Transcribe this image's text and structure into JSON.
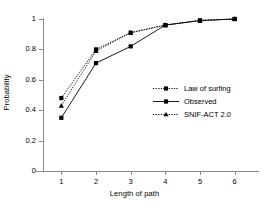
{
  "chart_data": {
    "type": "line",
    "title": "",
    "xlabel": "Length of path",
    "ylabel": "Probability",
    "x": [
      1,
      2,
      3,
      4,
      5,
      6
    ],
    "categories": [
      "1",
      "2",
      "3",
      "4",
      "5",
      "6"
    ],
    "xtick_labels": [
      "1",
      "2",
      "3",
      "4",
      "5",
      "6"
    ],
    "ytick_labels": [
      "0",
      "0.2",
      "0.4",
      "0.6",
      "0.8",
      "1"
    ],
    "ytick_values": [
      0,
      0.2,
      0.4,
      0.6,
      0.8,
      1
    ],
    "ylim": [
      0,
      1
    ],
    "xlim": [
      0.5,
      6.5
    ],
    "grid": false,
    "legend_position": "center-right",
    "series": [
      {
        "name": "Law of surfing",
        "values": [
          0.48,
          0.8,
          0.91,
          0.96,
          0.99,
          1.0
        ],
        "marker": "square",
        "line_style": "dotted",
        "color": "#000000"
      },
      {
        "name": "Observed",
        "values": [
          0.35,
          0.71,
          0.82,
          0.96,
          0.99,
          1.0
        ],
        "marker": "square",
        "line_style": "solid",
        "color": "#000000"
      },
      {
        "name": "SNIF-ACT 2.0",
        "values": [
          0.43,
          0.79,
          0.91,
          0.96,
          0.99,
          1.0
        ],
        "marker": "triangle",
        "line_style": "dotted",
        "color": "#000000"
      }
    ]
  },
  "axes": {
    "x_title": "Length of path",
    "y_title": "Probability"
  },
  "legend": {
    "entries": [
      {
        "label": "Law of surfing"
      },
      {
        "label": "Observed"
      },
      {
        "label": "SNIF-ACT 2.0"
      }
    ]
  },
  "colors": {
    "ink": "#000000",
    "axis": "#8a8a8a",
    "background": "#ffffff"
  }
}
